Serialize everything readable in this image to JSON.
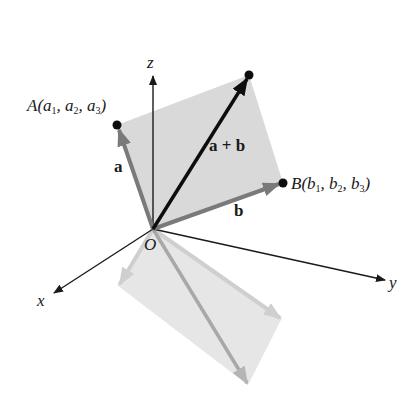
{
  "diagram": {
    "axes": {
      "x": {
        "label": "x"
      },
      "y": {
        "label": "y"
      },
      "z": {
        "label": "z"
      },
      "origin": {
        "label": "O"
      }
    },
    "points": {
      "A": {
        "name": "A",
        "coords": [
          "a",
          "a",
          "a"
        ],
        "subs": [
          "1",
          "2",
          "3"
        ]
      },
      "B": {
        "name": "B",
        "coords": [
          "b",
          "b",
          "b"
        ],
        "subs": [
          "1",
          "2",
          "3"
        ]
      }
    },
    "vectors": {
      "a": {
        "label": "a"
      },
      "b": {
        "label": "b"
      },
      "sum": {
        "label": "a + b"
      }
    },
    "colors": {
      "axis": "#1a1a1a",
      "vector_gray": "#7a7a7a",
      "sum_vector": "#0d0d0d",
      "parallelogram": "#d9d9d9",
      "shadow": "#e6e6e6",
      "shadow_arrow": "#b5b5b5"
    }
  }
}
